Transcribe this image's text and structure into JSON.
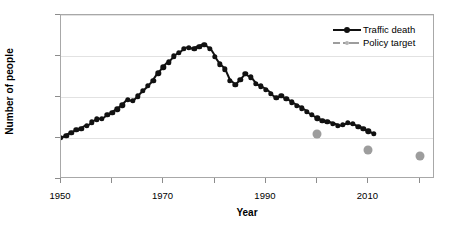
{
  "chart_data": {
    "type": "line",
    "title": "",
    "xlabel": "Year",
    "ylabel": "Number of people",
    "xlim": [
      1950,
      2023
    ],
    "ylim": [
      0,
      4000
    ],
    "grid": true,
    "legend_position": "top-right",
    "xticks": [
      1950,
      1970,
      1990,
      2010
    ],
    "xticks_minor": [
      1960,
      1980,
      2000,
      2020
    ],
    "yticks": [
      0,
      1000,
      2000,
      3000,
      4000
    ],
    "series": [
      {
        "name": "Traffic death",
        "color": "#111111",
        "style": "solid-line-with-round-markers",
        "x": [
          1950,
          1951,
          1952,
          1953,
          1954,
          1955,
          1956,
          1957,
          1958,
          1959,
          1960,
          1961,
          1962,
          1963,
          1964,
          1965,
          1966,
          1967,
          1968,
          1969,
          1970,
          1971,
          1972,
          1973,
          1974,
          1975,
          1976,
          1977,
          1978,
          1979,
          1980,
          1981,
          1982,
          1983,
          1984,
          1985,
          1986,
          1987,
          1988,
          1989,
          1990,
          1991,
          1992,
          1993,
          1994,
          1995,
          1996,
          1997,
          1998,
          1999,
          2000,
          2001,
          2002,
          2003,
          2004,
          2005,
          2006,
          2007,
          2008,
          2009,
          2010,
          2011
        ],
        "values": [
          1000,
          1060,
          1120,
          1200,
          1230,
          1300,
          1380,
          1460,
          1470,
          1560,
          1620,
          1700,
          1800,
          1930,
          1900,
          2020,
          2150,
          2270,
          2400,
          2580,
          2720,
          2850,
          2990,
          3080,
          3180,
          3200,
          3180,
          3230,
          3280,
          3180,
          2980,
          2800,
          2680,
          2400,
          2300,
          2420,
          2560,
          2480,
          2320,
          2260,
          2180,
          2080,
          1980,
          2030,
          1960,
          1870,
          1790,
          1720,
          1640,
          1560,
          1480,
          1420,
          1400,
          1350,
          1300,
          1320,
          1370,
          1340,
          1280,
          1220,
          1160,
          1100
        ]
      },
      {
        "name": "Policy target",
        "color": "#9d9d9d",
        "style": "dash-dot-line-with-round-markers",
        "x": [
          2000,
          2010,
          2020
        ],
        "values": [
          1100,
          700,
          550
        ]
      }
    ]
  },
  "legend": {
    "entries": [
      {
        "label": "Traffic death"
      },
      {
        "label": "Policy target"
      }
    ]
  },
  "axes": {
    "ylabel": "Number of people",
    "xlabel": "Year",
    "ytick_labels": [
      "4000",
      "3000",
      "2000",
      "1000",
      "0"
    ],
    "xtick_labels": [
      "1950",
      "1970",
      "1990",
      "2010"
    ]
  },
  "colors": {
    "series_traffic_death": "#111111",
    "series_policy_target": "#9d9d9d",
    "grid": "#e2e2e2",
    "frame": "#a8a8a8",
    "background": "#ffffff"
  }
}
